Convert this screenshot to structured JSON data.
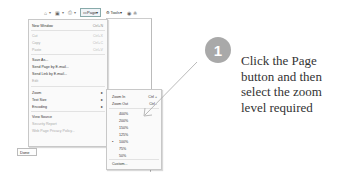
{
  "toolbar": {
    "items": [
      {
        "icon": "home-icon",
        "glyph": "⌂"
      },
      {
        "icon": "feeds-icon",
        "glyph": "▣"
      },
      {
        "icon": "print-icon",
        "glyph": "⎙"
      }
    ],
    "page_label": "Page",
    "tools_label": "Tools",
    "dropdown_glyph": "▾",
    "extra_icons": [
      {
        "icon": "help-icon",
        "glyph": "◉"
      },
      {
        "icon": "research-icon",
        "glyph": "≗"
      }
    ]
  },
  "page_menu": {
    "items": [
      {
        "label": "New Window",
        "shortcut": "Ctrl+N",
        "disabled": false
      },
      {
        "label": "Cut",
        "shortcut": "Ctrl+X",
        "disabled": true
      },
      {
        "label": "Copy",
        "shortcut": "Ctrl+C",
        "disabled": true
      },
      {
        "label": "Paste",
        "shortcut": "Ctrl+V",
        "disabled": true
      },
      {
        "label": "Save As...",
        "shortcut": "",
        "disabled": false
      },
      {
        "label": "Send Page by E-mail...",
        "shortcut": "",
        "disabled": false
      },
      {
        "label": "Send Link by E-mail...",
        "shortcut": "",
        "disabled": false
      },
      {
        "label": "Edit",
        "shortcut": "",
        "disabled": true
      },
      {
        "label": "Zoom",
        "shortcut": "▸",
        "disabled": false
      },
      {
        "label": "Text Size",
        "shortcut": "▸",
        "disabled": false
      },
      {
        "label": "Encoding",
        "shortcut": "▸",
        "disabled": false
      },
      {
        "label": "View Source",
        "shortcut": "",
        "disabled": false
      },
      {
        "label": "Security Report",
        "shortcut": "",
        "disabled": true
      },
      {
        "label": "Web Page Privacy Policy...",
        "shortcut": "",
        "disabled": true
      }
    ]
  },
  "zoom_submenu": {
    "items": [
      {
        "label": "Zoom In",
        "shortcut": "Ctrl +"
      },
      {
        "label": "Zoom Out",
        "shortcut": "Ctrl -"
      },
      {
        "label": "400%",
        "shortcut": ""
      },
      {
        "label": "200%",
        "shortcut": ""
      },
      {
        "label": "150%",
        "shortcut": ""
      },
      {
        "label": "125%",
        "shortcut": ""
      },
      {
        "label": "100%",
        "shortcut": "",
        "selected": true
      },
      {
        "label": "75%",
        "shortcut": ""
      },
      {
        "label": "50%",
        "shortcut": ""
      },
      {
        "label": "Custom...",
        "shortcut": ""
      }
    ],
    "selected_bullet": "•"
  },
  "status_bar": {
    "done_label": "Done"
  },
  "step": {
    "number": "1",
    "lines": [
      "Click the Page",
      "button and then",
      "select the zoom",
      "level required"
    ],
    "circle_color": "#a9a9a9"
  }
}
